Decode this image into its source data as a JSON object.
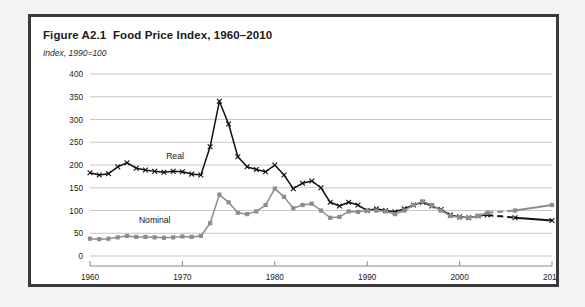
{
  "figure": {
    "title": "Figure A2.1  Food Price Index, 1960–2010",
    "subtitle": "Index, 1990=100"
  },
  "chart_data": {
    "type": "line",
    "title": "Figure A2.1  Food Price Index, 1960–2010",
    "subtitle": "Index, 1990=100",
    "xlabel": "",
    "ylabel": "Index, 1990=100",
    "xlim": [
      1960,
      2010
    ],
    "ylim": [
      0,
      400
    ],
    "yticks": [
      0,
      50,
      100,
      150,
      200,
      250,
      300,
      350,
      400
    ],
    "xticks": [
      1960,
      1970,
      1980,
      1990,
      2000,
      2010
    ],
    "grid": true,
    "legend": "inline-labels",
    "series": [
      {
        "name": "Real",
        "color": "#111111",
        "label_x": 1969.2,
        "label_y": 213,
        "marker": "x",
        "x": [
          1960,
          1961,
          1962,
          1963,
          1964,
          1965,
          1966,
          1967,
          1968,
          1969,
          1970,
          1971,
          1972,
          1973,
          1974,
          1975,
          1976,
          1977,
          1978,
          1979,
          1980,
          1981,
          1982,
          1983,
          1984,
          1985,
          1986,
          1987,
          1988,
          1989,
          1990,
          1991,
          1992,
          1993,
          1994,
          1995,
          1996,
          1997,
          1998,
          1999,
          2000,
          2001,
          2002,
          2003
        ],
        "values": [
          183,
          178,
          181,
          196,
          205,
          193,
          189,
          186,
          184,
          186,
          185,
          180,
          178,
          240,
          340,
          290,
          218,
          196,
          190,
          185,
          200,
          178,
          148,
          160,
          165,
          150,
          118,
          110,
          118,
          112,
          100,
          104,
          100,
          97,
          104,
          112,
          118,
          110,
          102,
          90,
          86,
          84,
          88,
          90
        ],
        "forecast_x": [
          2003,
          2006,
          2006,
          2010
        ],
        "forecast_values": [
          90,
          84,
          84,
          78
        ],
        "forecast_style": "dashed",
        "forecast_endpoints": [
          [
            2006,
            84
          ],
          [
            2010,
            78
          ]
        ]
      },
      {
        "name": "Nominal",
        "color": "#8c8c8c",
        "label_x": 1967.0,
        "label_y": 72,
        "marker": "square",
        "x": [
          1960,
          1961,
          1962,
          1963,
          1964,
          1965,
          1966,
          1967,
          1968,
          1969,
          1970,
          1971,
          1972,
          1973,
          1974,
          1975,
          1976,
          1977,
          1978,
          1979,
          1980,
          1981,
          1982,
          1983,
          1984,
          1985,
          1986,
          1987,
          1988,
          1989,
          1990,
          1991,
          1992,
          1993,
          1994,
          1995,
          1996,
          1997,
          1998,
          1999,
          2000,
          2001,
          2002,
          2003
        ],
        "values": [
          38,
          37,
          38,
          41,
          44,
          42,
          42,
          41,
          40,
          41,
          43,
          42,
          44,
          72,
          135,
          118,
          95,
          92,
          98,
          112,
          148,
          130,
          105,
          112,
          115,
          100,
          84,
          86,
          98,
          97,
          100,
          100,
          98,
          92,
          100,
          112,
          120,
          112,
          100,
          88,
          85,
          84,
          88,
          95
        ],
        "forecast_x": [
          2003,
          2006,
          2006,
          2010
        ],
        "forecast_values": [
          95,
          100,
          100,
          112
        ],
        "forecast_style": "dashed",
        "forecast_endpoints": [
          [
            2006,
            100
          ],
          [
            2010,
            112
          ]
        ]
      }
    ]
  }
}
